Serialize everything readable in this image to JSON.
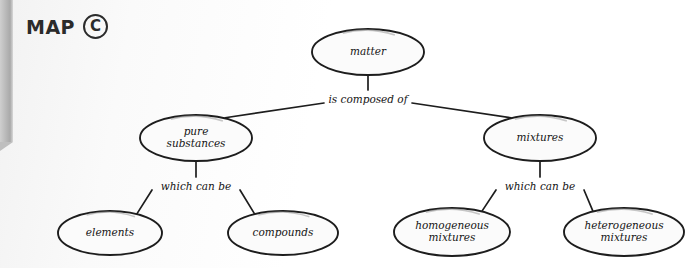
{
  "header": {
    "title": "MAP",
    "letter": "C"
  },
  "diagram": {
    "type": "concept-map",
    "nodes": [
      {
        "id": "matter",
        "label": "matter",
        "lines": [
          "matter"
        ],
        "level": 0,
        "cx": 368,
        "cy": 52,
        "rx": 56,
        "ry": 23
      },
      {
        "id": "pure-substances",
        "label": "pure substances",
        "lines": [
          "pure",
          "substances"
        ],
        "level": 1,
        "cx": 196,
        "cy": 138,
        "rx": 56,
        "ry": 23
      },
      {
        "id": "mixtures",
        "label": "mixtures",
        "lines": [
          "mixtures"
        ],
        "level": 1,
        "cx": 540,
        "cy": 138,
        "rx": 56,
        "ry": 23
      },
      {
        "id": "elements",
        "label": "elements",
        "lines": [
          "elements"
        ],
        "level": 2,
        "cx": 110,
        "cy": 233,
        "rx": 52,
        "ry": 22
      },
      {
        "id": "compounds",
        "label": "compounds",
        "lines": [
          "compounds"
        ],
        "level": 2,
        "cx": 283,
        "cy": 233,
        "rx": 55,
        "ry": 22
      },
      {
        "id": "homogeneous-mixtures",
        "label": "homogeneous mixtures",
        "lines": [
          "homogeneous",
          "mixtures"
        ],
        "level": 2,
        "cx": 452,
        "cy": 232,
        "rx": 58,
        "ry": 24
      },
      {
        "id": "heterogeneous-mixtures",
        "label": "heterogeneous mixtures",
        "lines": [
          "heterogeneous",
          "mixtures"
        ],
        "level": 2,
        "cx": 624,
        "cy": 232,
        "rx": 60,
        "ry": 24
      }
    ],
    "link_labels": [
      {
        "id": "is-composed-of",
        "text": "is composed of",
        "x": 368,
        "y": 100,
        "from": "matter",
        "to": [
          "pure-substances",
          "mixtures"
        ]
      },
      {
        "id": "which-can-be-left",
        "text": "which can be",
        "x": 196,
        "y": 187,
        "from": "pure-substances",
        "to": [
          "elements",
          "compounds"
        ]
      },
      {
        "id": "which-can-be-right",
        "text": "which can be",
        "x": 540,
        "y": 187,
        "from": "mixtures",
        "to": [
          "homogeneous-mixtures",
          "heterogeneous-mixtures"
        ]
      }
    ]
  },
  "colors": {
    "ink": "#1d1d1d",
    "node_fill": "#fbfbfb",
    "page_edge": "#b9b9b9"
  }
}
